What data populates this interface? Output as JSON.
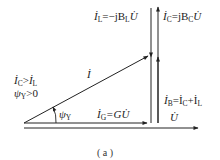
{
  "diagram": {
    "caption": "( a )",
    "condition_1": {
      "I": "İ",
      "sub_c": "C",
      "op": ">",
      "I2": "İ",
      "sub_l": "L"
    },
    "condition_2": {
      "psi": "ψ",
      "sub": "Y",
      "rest": ">0"
    },
    "angle_label": {
      "psi": "ψ",
      "sub": "Y"
    },
    "phasor_I": {
      "I": "İ"
    },
    "phasor_IG": {
      "I": "İ",
      "sub": "G",
      "rest": "=GU̇"
    },
    "phasor_IL": {
      "I": "İ",
      "sub": "L",
      "mid": "=−jB",
      "sub2": "L",
      "rest": "U̇"
    },
    "phasor_IC": {
      "I": "İ",
      "sub": "C",
      "mid": "=jB",
      "sub2": "C",
      "rest": "U̇"
    },
    "phasor_IB": {
      "I": "İ",
      "sub": "B",
      "eq": "=İ",
      "sub2": "C",
      "plus": "+İ",
      "sub3": "L"
    },
    "phasor_U": {
      "U": "U̇"
    },
    "stroke_color": "#222222"
  }
}
